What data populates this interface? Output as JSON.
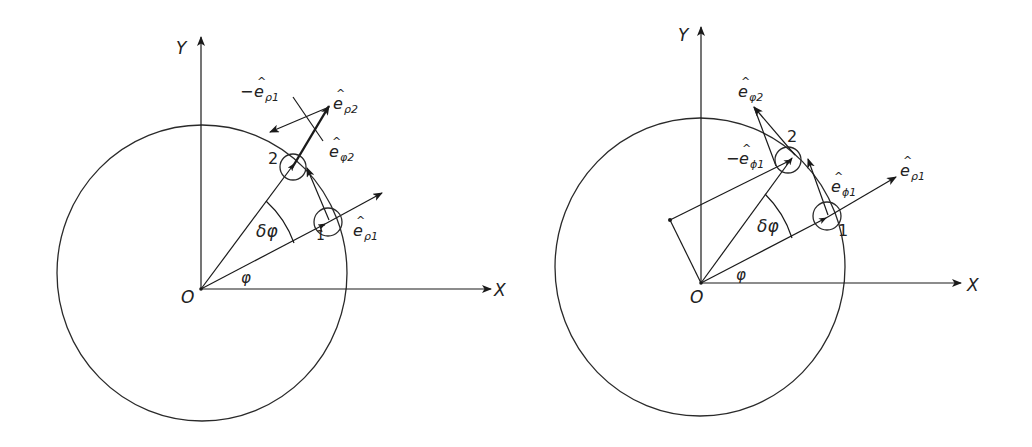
{
  "figure": {
    "panels": [
      {
        "id": "left",
        "axis_labels": {
          "x": "X",
          "y": "Y",
          "origin": "O"
        },
        "angle_labels": {
          "phi": "φ",
          "delta_phi": "δφ"
        },
        "point_labels": {
          "p1": "1",
          "p2": "2"
        },
        "vector_labels": {
          "e_rho1": {
            "minus": "",
            "base": "e",
            "sub": "ρ1"
          },
          "e_rho2": {
            "minus": "",
            "base": "e",
            "sub": "ρ2"
          },
          "minus_e_rho1": {
            "minus": "−",
            "base": "e",
            "sub": "ρ1"
          },
          "e_phi2": {
            "minus": "",
            "base": "e",
            "sub": "φ2"
          }
        }
      },
      {
        "id": "right",
        "axis_labels": {
          "x": "X",
          "y": "Y",
          "origin": "O"
        },
        "angle_labels": {
          "phi": "φ",
          "delta_phi": "δφ"
        },
        "point_labels": {
          "p1": "1",
          "p2": "2"
        },
        "vector_labels": {
          "e_rho1": {
            "minus": "",
            "base": "e",
            "sub": "ρ1"
          },
          "e_phi1": {
            "minus": "",
            "base": "e",
            "sub": "ϕ1"
          },
          "minus_e_phi1": {
            "minus": "−",
            "base": "e",
            "sub": "ϕ1"
          },
          "e_phi2": {
            "minus": "",
            "base": "e",
            "sub": "φ2"
          }
        }
      }
    ],
    "hat_glyph": "^",
    "colors": {
      "line": "#1a1a1a",
      "background": "#ffffff"
    }
  }
}
